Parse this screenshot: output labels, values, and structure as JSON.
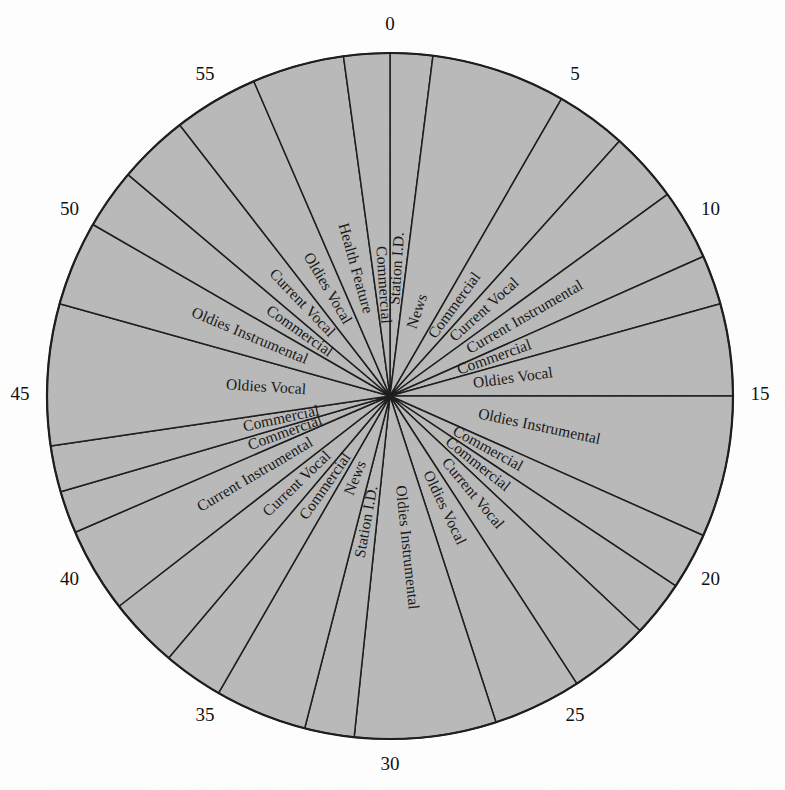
{
  "figure": {
    "kind": "radio-programming-clock",
    "shape": "circle",
    "center_x": 390,
    "center_y": 396,
    "radius": 343,
    "fill_color": "#b9b9b9",
    "line_color": "#1a1a1a",
    "background_color": "#ffffff",
    "minutes_in_hour": 60
  },
  "tick_labels": [
    {
      "text": "0",
      "minute": 0
    },
    {
      "text": "5",
      "minute": 5
    },
    {
      "text": "10",
      "minute": 10
    },
    {
      "text": "15",
      "minute": 15
    },
    {
      "text": "20",
      "minute": 20
    },
    {
      "text": "25",
      "minute": 25
    },
    {
      "text": "30",
      "minute": 30
    },
    {
      "text": "35",
      "minute": 35
    },
    {
      "text": "40",
      "minute": 40
    },
    {
      "text": "45",
      "minute": 45
    },
    {
      "text": "50",
      "minute": 50
    },
    {
      "text": "55",
      "minute": 55
    }
  ],
  "chart_data": {
    "type": "pie",
    "title": "",
    "xlabel": "",
    "ylabel": "",
    "units": "minutes",
    "total": 60,
    "legend_position": "none",
    "grid": false,
    "categories": [
      "Station I.D.",
      "News",
      "Commercial",
      "Current Vocal",
      "Current Instrumental",
      "Commercial",
      "Oldies Vocal",
      "Oldies Instrumental",
      "Commercial",
      "Commercial",
      "Current Vocal",
      "Oldies Vocal",
      "Oldies Instrumental",
      "Station I.D.",
      "News",
      "Commercial",
      "Current Vocal",
      "Current Instrumental",
      "Commercial",
      "Commercial",
      "Oldies Vocal",
      "Oldies Instrumental",
      "Commercial",
      "Current Vocal",
      "Oldies Vocal",
      "Health Feature",
      "Commercial"
    ],
    "values": [
      1.2,
      3.8,
      2.0,
      2.0,
      2.0,
      1.4,
      2.6,
      4.0,
      1.6,
      1.6,
      2.3,
      2.5,
      4.0,
      1.4,
      2.6,
      1.7,
      2.0,
      2.4,
      1.2,
      1.3,
      4.0,
      2.4,
      1.7,
      2.0,
      2.4,
      2.6,
      1.3
    ],
    "start_minutes": [
      0.0,
      1.2,
      5.0,
      7.0,
      9.0,
      11.0,
      12.4,
      15.0,
      19.0,
      20.6,
      22.2,
      24.5,
      27.0,
      31.0,
      32.4,
      35.0,
      36.7,
      38.7,
      41.1,
      42.3,
      43.6,
      47.6,
      50.0,
      51.7,
      53.7,
      56.1,
      58.7
    ],
    "end_minutes": [
      1.2,
      5.0,
      7.0,
      9.0,
      11.0,
      12.4,
      15.0,
      19.0,
      20.6,
      22.2,
      24.5,
      27.0,
      31.0,
      32.4,
      35.0,
      36.7,
      38.7,
      41.1,
      42.3,
      43.6,
      47.6,
      50.0,
      51.7,
      53.7,
      56.1,
      58.7,
      60.0
    ]
  }
}
